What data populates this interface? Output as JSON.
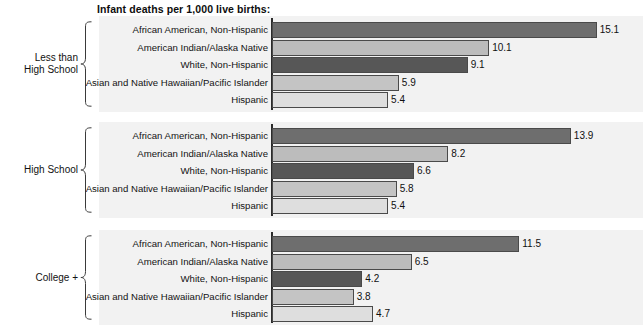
{
  "chart_data": {
    "type": "bar",
    "orientation": "horizontal",
    "title": "Infant deaths per 1,000 live births:",
    "xlabel": "",
    "ylabel": "",
    "xlim": [
      0,
      16
    ],
    "grid": false,
    "legend": false,
    "axis_visible": "left-only",
    "categories": [
      "African American, Non-Hispanic",
      "American Indian/Alaska Native",
      "White, Non-Hispanic",
      "Asian and Native Hawaiian/Pacific Islander",
      "Hispanic"
    ],
    "category_colors": [
      "#6e6e6e",
      "#bcbcbc",
      "#575757",
      "#c4c4c4",
      "#dedede"
    ],
    "panels": [
      {
        "group_label": "Less than\nHigh School",
        "group_label_line1": "Less than",
        "group_label_line2": "High School",
        "values": [
          15.1,
          10.1,
          9.1,
          5.9,
          5.4
        ],
        "value_labels": [
          "15.1",
          "10.1",
          "9.1",
          "5.9",
          "5.4"
        ]
      },
      {
        "group_label": "High School",
        "group_label_line1": "High School",
        "group_label_line2": "",
        "values": [
          13.9,
          8.2,
          6.6,
          5.8,
          5.4
        ],
        "value_labels": [
          "13.9",
          "8.2",
          "6.6",
          "5.8",
          "5.4"
        ]
      },
      {
        "group_label": "College +",
        "group_label_line1": "College +",
        "group_label_line2": "",
        "values": [
          11.5,
          6.5,
          4.2,
          3.8,
          4.7
        ],
        "value_labels": [
          "11.5",
          "6.5",
          "4.2",
          "3.8",
          "4.7"
        ]
      }
    ]
  },
  "colors": {
    "panel_background": "#f2f2f2",
    "page_background": "#ffffff",
    "axis": "#2b2b2b",
    "bar_outline": "#4a4a4a",
    "text": "#111111"
  },
  "layout": {
    "px_per_unit": 21.5,
    "axis_x": 272,
    "panel_tops": [
      16,
      122,
      230
    ],
    "panel_heights": [
      96,
      96,
      95
    ],
    "row_height": 16,
    "rows_start_offset": 6
  }
}
